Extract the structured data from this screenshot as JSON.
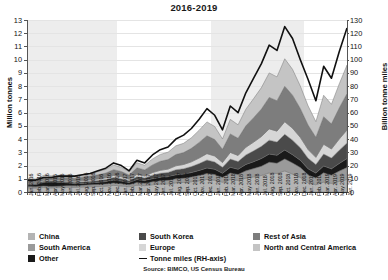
{
  "chart_data": {
    "type": "area",
    "title": "2016-2019",
    "subtitle": "",
    "xlabel": "",
    "ylabel": "Million tonnes",
    "y2label": "Billion tonne miles",
    "ylim": [
      0,
      13
    ],
    "y2lim": [
      0,
      130
    ],
    "yticks": [
      0,
      1,
      2,
      3,
      4,
      5,
      6,
      7,
      8,
      9,
      10,
      11,
      12,
      13
    ],
    "y2ticks": [
      0,
      10,
      20,
      30,
      40,
      50,
      60,
      70,
      80,
      90,
      100,
      110,
      120,
      130
    ],
    "grid": true,
    "stacked": true,
    "legend_position": "bottom",
    "source": "Source: BIMCO, US Census Bureau",
    "categories": [
      "Jan. 2016",
      "Feb. 2016",
      "Mar. 2016",
      "Apr. 2016",
      "May 2016",
      "Jun. 2016",
      "Jul. 2016",
      "Aug. 2016",
      "Sep. 2016",
      "Oct. 2016",
      "Nov. 2016",
      "Dec. 2016",
      "Jan. 2017",
      "Feb. 2017",
      "Mar. 2017",
      "Apr. 2017",
      "May 2017",
      "Jun. 2017",
      "Jul. 2017",
      "Aug. 2017",
      "Sep. 2017",
      "Oct. 2017",
      "Nov. 2017",
      "Dec. 2017",
      "Jan. 2018",
      "Feb. 2018",
      "Mar. 2018",
      "Apr. 2018",
      "May 2018",
      "Jun. 2018",
      "Jul. 2018",
      "Aug. 2018",
      "Sep. 2018",
      "Oct. 2018",
      "Nov. 2018",
      "Dec. 2018",
      "Jan. 2019",
      "Feb. 2019",
      "Mar. 2019",
      "Apr. 2019",
      "May 2019",
      "Jun. 2019"
    ],
    "series": [
      {
        "name": "China",
        "color": "#b4b4b4",
        "values": [
          0.32,
          0.3,
          0.34,
          0.31,
          0.33,
          0.36,
          0.35,
          0.38,
          0.4,
          0.42,
          0.45,
          0.5,
          0.46,
          0.4,
          0.52,
          0.48,
          0.55,
          0.6,
          0.62,
          0.7,
          0.72,
          0.78,
          0.85,
          0.95,
          0.9,
          0.75,
          0.95,
          0.88,
          1.05,
          1.15,
          1.25,
          1.45,
          1.4,
          1.6,
          1.35,
          1.1,
          0.7,
          0.55,
          0.75,
          0.65,
          0.8,
          0.95
        ]
      },
      {
        "name": "South America",
        "color": "#9a9a9a",
        "values": [
          0.1,
          0.09,
          0.11,
          0.1,
          0.11,
          0.12,
          0.12,
          0.13,
          0.14,
          0.15,
          0.16,
          0.18,
          0.17,
          0.15,
          0.2,
          0.18,
          0.22,
          0.25,
          0.26,
          0.3,
          0.32,
          0.35,
          0.4,
          0.45,
          0.42,
          0.35,
          0.48,
          0.44,
          0.55,
          0.62,
          0.7,
          0.8,
          0.78,
          0.9,
          0.85,
          0.75,
          0.6,
          0.5,
          0.7,
          0.62,
          0.78,
          0.9
        ]
      },
      {
        "name": "Other",
        "color": "#1a1a1a",
        "values": [
          0.12,
          0.18,
          0.28,
          0.35,
          0.3,
          0.22,
          0.16,
          0.14,
          0.15,
          0.16,
          0.18,
          0.22,
          0.2,
          0.16,
          0.22,
          0.2,
          0.24,
          0.26,
          0.28,
          0.3,
          0.32,
          0.34,
          0.38,
          0.42,
          0.4,
          0.32,
          0.44,
          0.4,
          0.48,
          0.52,
          0.58,
          0.62,
          0.6,
          0.68,
          0.62,
          0.55,
          0.45,
          0.38,
          0.52,
          0.48,
          0.58,
          0.68
        ]
      },
      {
        "name": "South Korea",
        "color": "#4a4a4a",
        "values": [
          0.08,
          0.07,
          0.09,
          0.08,
          0.09,
          0.1,
          0.1,
          0.12,
          0.13,
          0.14,
          0.16,
          0.2,
          0.18,
          0.14,
          0.22,
          0.2,
          0.26,
          0.3,
          0.32,
          0.38,
          0.4,
          0.45,
          0.52,
          0.6,
          0.55,
          0.45,
          0.62,
          0.58,
          0.72,
          0.82,
          0.92,
          1.05,
          1.0,
          1.18,
          1.1,
          0.95,
          0.8,
          0.65,
          0.9,
          0.82,
          1.0,
          1.18
        ]
      },
      {
        "name": "Europe",
        "color": "#d6d6d6",
        "values": [
          0.06,
          0.05,
          0.07,
          0.06,
          0.07,
          0.08,
          0.08,
          0.09,
          0.1,
          0.11,
          0.12,
          0.15,
          0.14,
          0.11,
          0.17,
          0.15,
          0.2,
          0.23,
          0.25,
          0.3,
          0.32,
          0.36,
          0.42,
          0.48,
          0.45,
          0.36,
          0.5,
          0.46,
          0.58,
          0.66,
          0.74,
          0.85,
          0.82,
          0.95,
          0.9,
          0.78,
          0.66,
          0.54,
          0.74,
          0.68,
          0.84,
          0.98
        ]
      },
      {
        "name": "Rest of Asia",
        "color": "#7d7d7d",
        "values": [
          0.18,
          0.16,
          0.2,
          0.18,
          0.2,
          0.22,
          0.22,
          0.26,
          0.28,
          0.32,
          0.36,
          0.44,
          0.4,
          0.32,
          0.5,
          0.46,
          0.58,
          0.68,
          0.72,
          0.85,
          0.9,
          1.02,
          1.18,
          1.35,
          1.25,
          1.0,
          1.4,
          1.3,
          1.62,
          1.85,
          2.08,
          2.38,
          2.3,
          2.68,
          2.5,
          2.18,
          1.85,
          1.52,
          2.08,
          1.9,
          2.35,
          2.75
        ]
      },
      {
        "name": "North and Central America",
        "color": "#c4c4c4",
        "values": [
          0.14,
          0.13,
          0.16,
          0.14,
          0.16,
          0.18,
          0.18,
          0.2,
          0.22,
          0.25,
          0.28,
          0.34,
          0.31,
          0.25,
          0.38,
          0.35,
          0.45,
          0.52,
          0.56,
          0.66,
          0.7,
          0.8,
          0.92,
          1.05,
          0.98,
          0.78,
          1.1,
          1.02,
          1.26,
          1.44,
          1.62,
          1.85,
          1.8,
          2.08,
          1.95,
          1.7,
          1.45,
          1.18,
          1.62,
          1.48,
          1.82,
          2.15
        ]
      }
    ],
    "line_series": {
      "name": "Tonne miles (RH-axis)",
      "color": "#111111",
      "axis": "right",
      "values": [
        9,
        9,
        11,
        11,
        12,
        12,
        12,
        13,
        14,
        16,
        18,
        22,
        20,
        16,
        24,
        22,
        28,
        32,
        34,
        40,
        43,
        48,
        55,
        63,
        58,
        47,
        65,
        60,
        75,
        86,
        97,
        111,
        107,
        125,
        116,
        100,
        85,
        69,
        95,
        86,
        106,
        124
      ]
    }
  },
  "legend": {
    "columns": [
      {
        "items": [
          {
            "label": "China",
            "type": "swatch",
            "color": "#b4b4b4",
            "icon": "legend-swatch-icon"
          },
          {
            "label": "South America",
            "type": "swatch",
            "color": "#9a9a9a",
            "icon": "legend-swatch-icon"
          },
          {
            "label": "Other",
            "type": "swatch",
            "color": "#1a1a1a",
            "icon": "legend-swatch-icon"
          }
        ]
      },
      {
        "items": [
          {
            "label": "South Korea",
            "type": "swatch",
            "color": "#4a4a4a",
            "icon": "legend-swatch-icon"
          },
          {
            "label": "Europe",
            "type": "swatch",
            "color": "#d6d6d6",
            "icon": "legend-swatch-icon"
          },
          {
            "label": "Tonne miles (RH-axis)",
            "type": "line",
            "color": "#111111",
            "icon": "legend-line-icon"
          }
        ]
      },
      {
        "items": [
          {
            "label": "Rest of Asia",
            "type": "swatch",
            "color": "#7d7d7d",
            "icon": "legend-swatch-icon"
          },
          {
            "label": "North and Central America",
            "type": "swatch",
            "color": "#c4c4c4",
            "icon": "legend-swatch-icon"
          }
        ]
      }
    ]
  }
}
